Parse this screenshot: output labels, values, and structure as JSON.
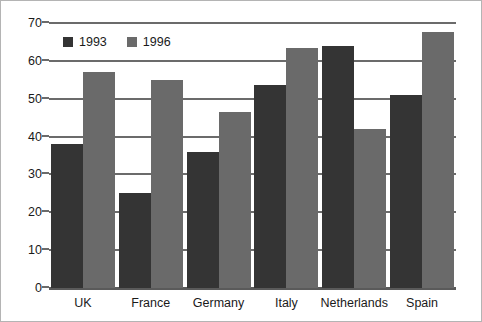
{
  "chart_data": {
    "type": "bar",
    "title": "",
    "subtitle": "",
    "xlabel": "",
    "ylabel": "",
    "categories": [
      "UK",
      "France",
      "Germany",
      "Italy",
      "Netherlands",
      "Spain"
    ],
    "series": [
      {
        "name": "1993",
        "color": "#343434",
        "values": [
          38,
          25,
          36,
          53.5,
          64,
          51
        ]
      },
      {
        "name": "1996",
        "color": "#6a6a6a",
        "values": [
          57,
          55,
          46.5,
          63.5,
          42,
          67.5
        ]
      }
    ],
    "ylim": [
      0,
      70
    ],
    "yticks": [
      0,
      10,
      20,
      30,
      40,
      50,
      60,
      70
    ],
    "ytick_labels": [
      "0",
      "10",
      "20",
      "30",
      "40",
      "50",
      "60",
      "70"
    ],
    "grid": true,
    "grid_axis": "y",
    "legend": {
      "position": "upper-left-inside",
      "entries": [
        "1993",
        "1996"
      ]
    },
    "frame": {
      "border_color": "#b4b4b4",
      "background": "#ffffff",
      "axis_color": "#6b6b6b"
    }
  }
}
